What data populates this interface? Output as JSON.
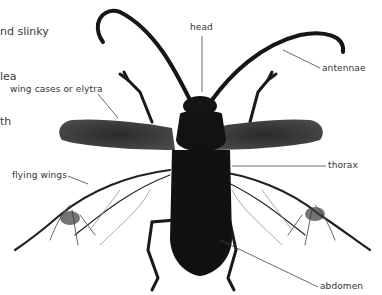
{
  "intro_text": {
    "lines": [
      "nd slinky",
      "lea",
      "th"
    ]
  },
  "labels": {
    "head": "head",
    "antennae": "antennae",
    "wing_cases": "wing cases or elytra",
    "flying_wings": "flying wings",
    "thorax": "thorax",
    "abdomen": "abdomen"
  },
  "colors": {
    "background": "#ffffff",
    "body": "#151515",
    "elytra": "#3c3c3c",
    "leader_line": "#444444",
    "text": "#333333"
  }
}
